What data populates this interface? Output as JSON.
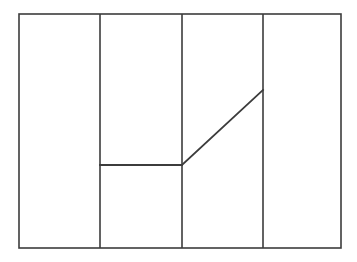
{
  "figure": {
    "title": "",
    "canvas": {
      "width": 357,
      "height": 262,
      "background": "#ffffff"
    },
    "stroke_color": "#3c3c3c",
    "stroke_width": 1.6,
    "outer_rect": {
      "name": "outer-rectangle",
      "x": 19,
      "y": 14,
      "width": 322,
      "height": 234,
      "left": 19,
      "top": 14,
      "right": 341,
      "bottom": 248
    },
    "vertical_dividers": [
      {
        "name": "divider-1",
        "x": 100,
        "y1": 14,
        "y2": 248
      },
      {
        "name": "divider-2",
        "x": 182,
        "y1": 14,
        "y2": 248
      },
      {
        "name": "divider-3",
        "x": 263,
        "y1": 14,
        "y2": 248
      }
    ],
    "horizontal_segment": {
      "name": "horizontal-segment",
      "x1": 100,
      "y1": 165,
      "x2": 182,
      "y2": 165
    },
    "diagonal_segment": {
      "name": "diagonal-segment",
      "x1": 182,
      "y1": 165,
      "x2": 263,
      "y2": 90
    }
  },
  "chart_data": {
    "type": "line",
    "title": "",
    "xlabel": "",
    "ylabel": "",
    "xlim": [
      19,
      341
    ],
    "ylim": [
      248,
      14
    ],
    "grid": false,
    "legend": null,
    "annotations": [],
    "tick_labels_x": [],
    "tick_labels_y": [],
    "vertical_gridlines_x": [
      100,
      182,
      263
    ],
    "series": [
      {
        "name": "profile-line",
        "points": [
          {
            "x": 100,
            "y": 165
          },
          {
            "x": 182,
            "y": 165
          },
          {
            "x": 263,
            "y": 90
          }
        ]
      }
    ]
  }
}
